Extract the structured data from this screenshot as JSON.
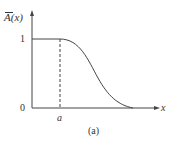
{
  "figure": {
    "ylabel": "A(x)",
    "xlabel": "x",
    "ytick_one": "1",
    "origin": "0",
    "xtick_a": "a",
    "caption": "(a)"
  },
  "colors": {
    "line": "#444444",
    "text": "#333333"
  }
}
